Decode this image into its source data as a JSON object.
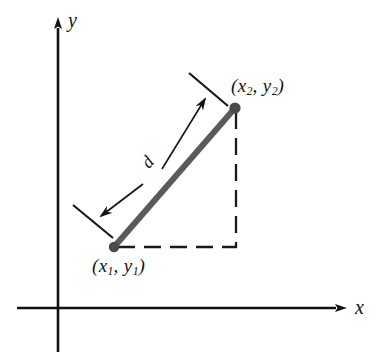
{
  "figure": {
    "background_color": "#ffffff"
  },
  "axes": {
    "x_label": "x",
    "y_label": "y",
    "axis_color": "#111111",
    "x_axis": {
      "y": 308,
      "x_start": 17,
      "x_end": 344,
      "arrow": "right"
    },
    "y_axis": {
      "x": 58,
      "y_start": 352,
      "y_end": 18,
      "arrow": "up"
    }
  },
  "segment": {
    "color": "#5a5a5a",
    "width": 6,
    "point1": {
      "label_open": "(",
      "x_var": "x",
      "x_sub": "1",
      "comma": ", ",
      "y_var": "y",
      "y_sub": "1",
      "label_close": ")",
      "px": 114,
      "py": 247
    },
    "point2": {
      "label_open": "(",
      "x_var": "x",
      "x_sub": "2",
      "comma": ", ",
      "y_var": "y",
      "y_sub": "2",
      "label_close": ")",
      "px": 235,
      "py": 108
    }
  },
  "dimension": {
    "label": "d",
    "color": "#141414",
    "arrow_start": {
      "x": 95,
      "y": 222
    },
    "arrow_end": {
      "x": 210,
      "y": 94
    }
  },
  "dashed_lines": {
    "color": "#1a1a1a",
    "horizontal": {
      "x_start": 118,
      "x_end": 237,
      "y": 247
    },
    "vertical": {
      "x": 236,
      "y_start": 110,
      "y_end": 247
    }
  }
}
